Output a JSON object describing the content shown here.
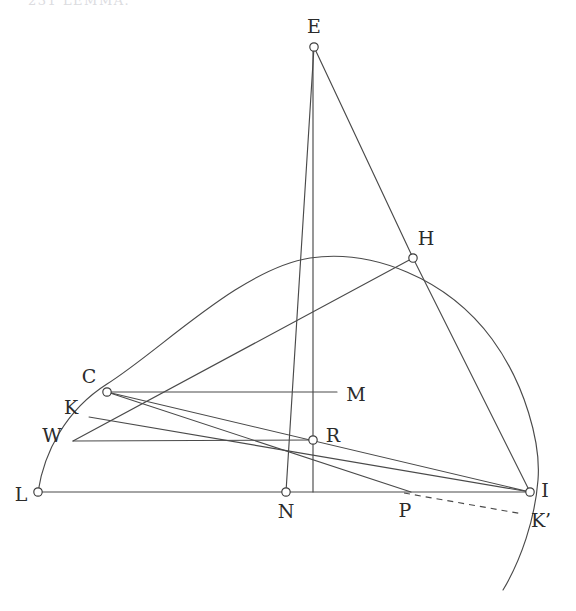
{
  "figure": {
    "width": 576,
    "height": 611,
    "background_color": "#ffffff",
    "stroke_color": "#4a4a4a",
    "label_color": "#2b2b2b",
    "top_fragment_text": "231     LEMMA.",
    "points": [
      {
        "id": "E",
        "label": "E",
        "x": 314,
        "y": 47,
        "label_x": 314,
        "label_y": 28,
        "marker": true
      },
      {
        "id": "H",
        "label": "H",
        "x": 413,
        "y": 258,
        "label_x": 426,
        "label_y": 240,
        "marker": true
      },
      {
        "id": "C",
        "label": "C",
        "x": 107,
        "y": 392,
        "label_x": 89,
        "label_y": 378,
        "marker": true
      },
      {
        "id": "K",
        "label": "K",
        "x": 89,
        "y": 417,
        "label_x": 71,
        "label_y": 409,
        "marker": false
      },
      {
        "id": "W",
        "label": "W",
        "x": 73,
        "y": 441,
        "label_x": 52,
        "label_y": 437,
        "marker": false
      },
      {
        "id": "M",
        "label": "M",
        "x": 337,
        "y": 392,
        "label_x": 356,
        "label_y": 396,
        "marker": false
      },
      {
        "id": "R",
        "label": "R",
        "x": 313,
        "y": 440,
        "label_x": 333,
        "label_y": 437,
        "marker": true
      },
      {
        "id": "L",
        "label": "L",
        "x": 38,
        "y": 492,
        "label_x": 21,
        "label_y": 496,
        "marker": true
      },
      {
        "id": "N",
        "label": "N",
        "x": 286,
        "y": 492,
        "label_x": 286,
        "label_y": 513,
        "marker": true
      },
      {
        "id": "P",
        "label": "P",
        "x": 411,
        "y": 492,
        "label_x": 405,
        "label_y": 512,
        "marker": false
      },
      {
        "id": "I",
        "label": "I",
        "x": 530,
        "y": 492,
        "label_x": 545,
        "label_y": 492,
        "marker": true
      },
      {
        "id": "Kp",
        "label": "K’",
        "x": 523,
        "y": 514,
        "label_x": 541,
        "label_y": 522,
        "marker": false
      }
    ],
    "segments": [
      {
        "name": "E-N",
        "from": [
          314,
          47
        ],
        "to": [
          286,
          492
        ],
        "style": "solid"
      },
      {
        "name": "E-H",
        "from": [
          314,
          47
        ],
        "to": [
          413,
          258
        ],
        "style": "solid"
      },
      {
        "name": "E-base-vertical",
        "from": [
          313,
          47
        ],
        "to": [
          313,
          492
        ],
        "style": "solid"
      },
      {
        "name": "H-W",
        "from": [
          413,
          258
        ],
        "to": [
          73,
          441
        ],
        "style": "solid"
      },
      {
        "name": "H-I",
        "from": [
          413,
          258
        ],
        "to": [
          530,
          492
        ],
        "style": "solid"
      },
      {
        "name": "L-I-baseline",
        "from": [
          38,
          492
        ],
        "to": [
          530,
          492
        ],
        "style": "solid"
      },
      {
        "name": "C-M-horizontal",
        "from": [
          107,
          392
        ],
        "to": [
          337,
          392
        ],
        "style": "solid"
      },
      {
        "name": "C-I",
        "from": [
          107,
          392
        ],
        "to": [
          530,
          492
        ],
        "style": "solid"
      },
      {
        "name": "C-P",
        "from": [
          107,
          392
        ],
        "to": [
          411,
          492
        ],
        "style": "solid"
      },
      {
        "name": "K-I",
        "from": [
          89,
          417
        ],
        "to": [
          530,
          492
        ],
        "style": "solid"
      },
      {
        "name": "W-R-horizontal",
        "from": [
          73,
          441
        ],
        "to": [
          313,
          440
        ],
        "style": "solid"
      },
      {
        "name": "P-Kprime-dashed",
        "from": [
          404,
          493
        ],
        "to": [
          523,
          514
        ],
        "style": "dashed"
      }
    ],
    "arcs": [
      {
        "name": "main-arc-L-to-bottom",
        "style": "solid",
        "path": "M 38 492 C 44 452 66 410 107 384 C 160 351 240 269 310 258 C 372 249 447 278 492 339 C 525 384 541 443 538 480 C 535 519 521 560 503 590"
      }
    ]
  }
}
